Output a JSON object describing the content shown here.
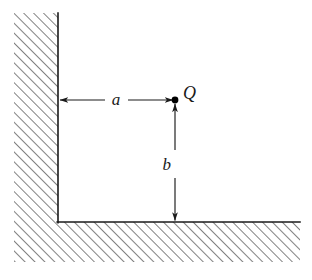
{
  "figure": {
    "width": 312,
    "height": 280,
    "background_color": "#ffffff",
    "line_color": "#1a1a1a",
    "hatch_color": "#6b6b6b"
  },
  "labels": {
    "charge": "Q",
    "horizontal_distance": "a",
    "vertical_distance": "b"
  },
  "geometry": {
    "charge_point": {
      "x": 175,
      "y": 100
    },
    "corner_point": {
      "x": 58,
      "y": 222
    },
    "vertical_wall": {
      "edge_x": 58,
      "hatch_left": 14,
      "top_y": 13,
      "bottom_y": 222
    },
    "horizontal_wall": {
      "edge_y": 222,
      "hatch_bottom": 262,
      "left_x": 14,
      "right_x": 300
    },
    "dimension_a": {
      "from_x": 58,
      "to_x": 175,
      "y": 100,
      "label_x": 115,
      "label_y": 105,
      "arrowheads": "both"
    },
    "dimension_b": {
      "x": 175,
      "from_y": 102,
      "to_y": 222,
      "label_x": 164,
      "label_y": 170,
      "arrowheads": "both"
    },
    "charge_label_position": {
      "x": 183,
      "y": 99
    },
    "hatch_angle_degrees": 45,
    "hatch_spacing": 7
  }
}
